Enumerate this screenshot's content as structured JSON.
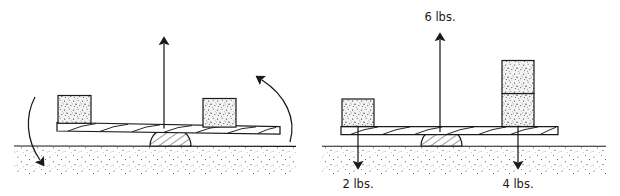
{
  "diagram": {
    "style": "hand-drawn line art, black ink on white paper",
    "colors": {
      "ink": "#1a1a1a",
      "paper": "#ffffff",
      "block_fill": "#f2f2f2",
      "ground_stipple": "#555555"
    },
    "panels": [
      {
        "id": "left",
        "name": "unbalanced-lever",
        "caption": "",
        "ground": {
          "label": "",
          "texture": "stippled soil"
        },
        "plank": {
          "label": "",
          "hatch": "diagonal wood hatching"
        },
        "fulcrum": {
          "label": "",
          "shape": "hatched half-dome"
        },
        "blocks": [
          {
            "name": "left-block",
            "label": "",
            "units": 1
          },
          {
            "name": "right-block",
            "label": "",
            "units": 1
          }
        ],
        "arrows": [
          {
            "name": "normal-force-arrow",
            "direction": "up",
            "label": ""
          },
          {
            "name": "rotation-arrow-left",
            "direction": "curved-down",
            "label": ""
          },
          {
            "name": "rotation-arrow-right",
            "direction": "curved-up",
            "label": ""
          }
        ]
      },
      {
        "id": "right",
        "name": "labeled-lever-forces",
        "caption": "",
        "ground": {
          "label": "",
          "texture": "stippled soil"
        },
        "plank": {
          "label": "",
          "hatch": "diagonal wood hatching"
        },
        "fulcrum": {
          "label": "",
          "shape": "hatched half-dome"
        },
        "blocks": [
          {
            "name": "left-block",
            "label": "",
            "units": 1
          },
          {
            "name": "right-block-lower",
            "label": "",
            "units": 1
          },
          {
            "name": "right-block-upper",
            "label": "",
            "units": 1
          }
        ],
        "arrows": [
          {
            "name": "normal-force-arrow",
            "direction": "up",
            "label": "6 lbs."
          },
          {
            "name": "left-weight-arrow",
            "direction": "down",
            "label": "2 lbs."
          },
          {
            "name": "right-weight-arrow",
            "direction": "down",
            "label": "4 lbs."
          }
        ]
      }
    ],
    "labels": {
      "up_force": "6 lbs.",
      "left_weight": "2 lbs.",
      "right_weight": "4 lbs."
    }
  }
}
